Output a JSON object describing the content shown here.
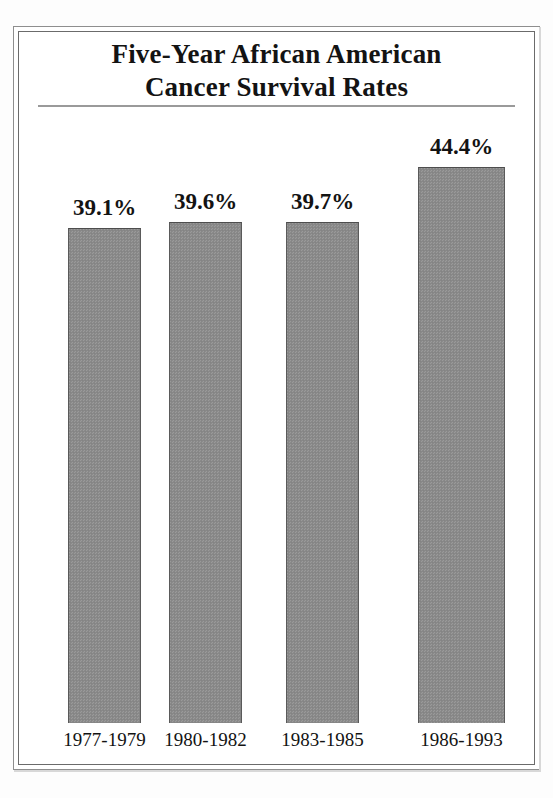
{
  "figure": {
    "title_lines": [
      "Five-Year African American",
      "Cancer Survival Rates"
    ],
    "border_color": "#6b6b6b",
    "rule_color": "#9a9a9a",
    "bar_fill_color": "#8b8b8b",
    "bar_edge_color": "#4d4d4d",
    "text_color": "#131313",
    "background_color": "#ffffff"
  },
  "chart_data": {
    "type": "bar",
    "title": "Five-Year African American Cancer Survival Rates",
    "xlabel": "",
    "ylabel": "",
    "categories": [
      "1977-1979",
      "1980-1982",
      "1983-1985",
      "1986-1993"
    ],
    "values": [
      39.1,
      39.6,
      39.7,
      44.4
    ],
    "value_labels": [
      "39.1%",
      "39.6%",
      "39.7%",
      "44.4%"
    ],
    "units": "percent",
    "ylim": [
      0,
      50
    ],
    "grid": false,
    "legend": null,
    "legend_position": "none",
    "axis_truncated": true,
    "bars": [
      {
        "category": "1977-1979",
        "value": 39.1,
        "label": "39.1%",
        "left_px": 68,
        "width_px": 73,
        "top_px": 228,
        "bottom_px": 723
      },
      {
        "category": "1980-1982",
        "value": 39.6,
        "label": "39.6%",
        "left_px": 169,
        "width_px": 73,
        "top_px": 222,
        "bottom_px": 723
      },
      {
        "category": "1983-1985",
        "value": 39.7,
        "label": "39.7%",
        "left_px": 286,
        "width_px": 73,
        "top_px": 222,
        "bottom_px": 723
      },
      {
        "category": "1986-1993",
        "value": 44.4,
        "label": "44.4%",
        "left_px": 418,
        "width_px": 87,
        "top_px": 167,
        "bottom_px": 723
      }
    ]
  }
}
